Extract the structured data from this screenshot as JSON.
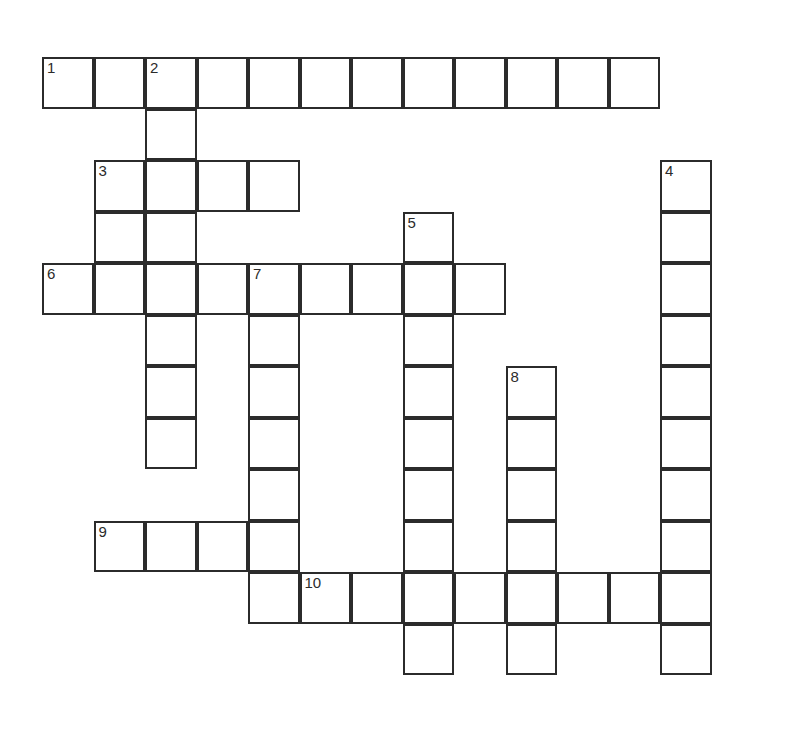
{
  "page": {
    "kind": "crossword-puzzle-grid",
    "width": 796,
    "height": 734,
    "background_color": "#ffffff"
  },
  "grid": {
    "columns": 13,
    "rows": 13,
    "cell_size": 51.5,
    "origin_x": 42,
    "origin_y": 57,
    "line_color": "#2b2b2b",
    "line_width": 2,
    "cell_fill": "#ffffff",
    "number_color": "#2b2b2b",
    "number_font_size": 15
  },
  "entries": {
    "across": [
      {
        "number": 1,
        "row": 1,
        "col": 1,
        "length": 12
      },
      {
        "number": 3,
        "row": 3,
        "col": 2,
        "length": 4
      },
      {
        "number": 6,
        "row": 5,
        "col": 1,
        "length": 9
      },
      {
        "number": 9,
        "row": 10,
        "col": 2,
        "length": 4
      },
      {
        "number": 10,
        "row": 11,
        "col": 6,
        "length": 8
      }
    ],
    "down": [
      {
        "number": 2,
        "row": 1,
        "col": 3,
        "length": 8
      },
      {
        "number": 4,
        "row": 3,
        "col": 13,
        "length": 10
      },
      {
        "number": 5,
        "row": 4,
        "col": 8,
        "length": 9
      },
      {
        "number": 7,
        "row": 5,
        "col": 5,
        "length": 7
      },
      {
        "number": 8,
        "row": 7,
        "col": 10,
        "length": 6
      }
    ]
  },
  "cells": [
    {
      "row": 1,
      "col": 1,
      "number": "1"
    },
    {
      "row": 1,
      "col": 2,
      "number": ""
    },
    {
      "row": 1,
      "col": 3,
      "number": "2"
    },
    {
      "row": 1,
      "col": 4,
      "number": ""
    },
    {
      "row": 1,
      "col": 5,
      "number": ""
    },
    {
      "row": 1,
      "col": 6,
      "number": ""
    },
    {
      "row": 1,
      "col": 7,
      "number": ""
    },
    {
      "row": 1,
      "col": 8,
      "number": ""
    },
    {
      "row": 1,
      "col": 9,
      "number": ""
    },
    {
      "row": 1,
      "col": 10,
      "number": ""
    },
    {
      "row": 1,
      "col": 11,
      "number": ""
    },
    {
      "row": 1,
      "col": 12,
      "number": ""
    },
    {
      "row": 2,
      "col": 3,
      "number": ""
    },
    {
      "row": 3,
      "col": 2,
      "number": "3"
    },
    {
      "row": 3,
      "col": 3,
      "number": ""
    },
    {
      "row": 3,
      "col": 4,
      "number": ""
    },
    {
      "row": 3,
      "col": 5,
      "number": ""
    },
    {
      "row": 3,
      "col": 13,
      "number": "4"
    },
    {
      "row": 4,
      "col": 2,
      "number": ""
    },
    {
      "row": 4,
      "col": 3,
      "number": ""
    },
    {
      "row": 4,
      "col": 8,
      "number": "5"
    },
    {
      "row": 4,
      "col": 13,
      "number": ""
    },
    {
      "row": 5,
      "col": 1,
      "number": "6"
    },
    {
      "row": 5,
      "col": 2,
      "number": ""
    },
    {
      "row": 5,
      "col": 3,
      "number": ""
    },
    {
      "row": 5,
      "col": 4,
      "number": ""
    },
    {
      "row": 5,
      "col": 5,
      "number": "7"
    },
    {
      "row": 5,
      "col": 6,
      "number": ""
    },
    {
      "row": 5,
      "col": 7,
      "number": ""
    },
    {
      "row": 5,
      "col": 8,
      "number": ""
    },
    {
      "row": 5,
      "col": 9,
      "number": ""
    },
    {
      "row": 5,
      "col": 13,
      "number": ""
    },
    {
      "row": 6,
      "col": 3,
      "number": ""
    },
    {
      "row": 6,
      "col": 5,
      "number": ""
    },
    {
      "row": 6,
      "col": 8,
      "number": ""
    },
    {
      "row": 6,
      "col": 13,
      "number": ""
    },
    {
      "row": 7,
      "col": 3,
      "number": ""
    },
    {
      "row": 7,
      "col": 5,
      "number": ""
    },
    {
      "row": 7,
      "col": 8,
      "number": ""
    },
    {
      "row": 7,
      "col": 10,
      "number": "8"
    },
    {
      "row": 7,
      "col": 13,
      "number": ""
    },
    {
      "row": 8,
      "col": 3,
      "number": ""
    },
    {
      "row": 8,
      "col": 5,
      "number": ""
    },
    {
      "row": 8,
      "col": 8,
      "number": ""
    },
    {
      "row": 8,
      "col": 10,
      "number": ""
    },
    {
      "row": 8,
      "col": 13,
      "number": ""
    },
    {
      "row": 9,
      "col": 5,
      "number": ""
    },
    {
      "row": 9,
      "col": 8,
      "number": ""
    },
    {
      "row": 9,
      "col": 10,
      "number": ""
    },
    {
      "row": 9,
      "col": 13,
      "number": ""
    },
    {
      "row": 10,
      "col": 2,
      "number": "9"
    },
    {
      "row": 10,
      "col": 3,
      "number": ""
    },
    {
      "row": 10,
      "col": 4,
      "number": ""
    },
    {
      "row": 10,
      "col": 5,
      "number": ""
    },
    {
      "row": 10,
      "col": 8,
      "number": ""
    },
    {
      "row": 10,
      "col": 10,
      "number": ""
    },
    {
      "row": 10,
      "col": 13,
      "number": ""
    },
    {
      "row": 11,
      "col": 5,
      "number": ""
    },
    {
      "row": 11,
      "col": 6,
      "number": "10"
    },
    {
      "row": 11,
      "col": 7,
      "number": ""
    },
    {
      "row": 11,
      "col": 8,
      "number": ""
    },
    {
      "row": 11,
      "col": 9,
      "number": ""
    },
    {
      "row": 11,
      "col": 10,
      "number": ""
    },
    {
      "row": 11,
      "col": 11,
      "number": ""
    },
    {
      "row": 11,
      "col": 12,
      "number": ""
    },
    {
      "row": 11,
      "col": 13,
      "number": ""
    },
    {
      "row": 12,
      "col": 8,
      "number": ""
    },
    {
      "row": 12,
      "col": 10,
      "number": ""
    },
    {
      "row": 12,
      "col": 13,
      "number": ""
    }
  ]
}
